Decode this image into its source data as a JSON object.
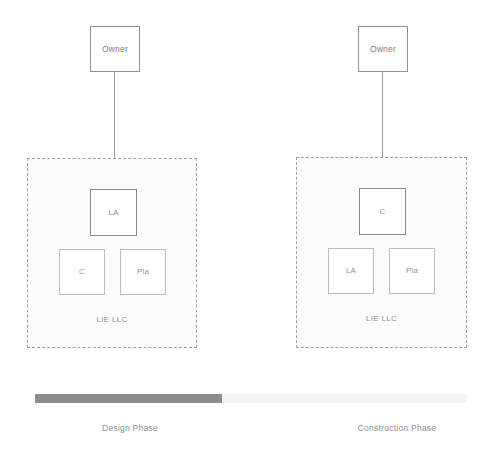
{
  "diagram": {
    "colors": {
      "box_border": "#909090",
      "primary_box_border": "#8d8d8d",
      "secondary_box_border": "#bdbdbd",
      "group_border": "#9f9f9f",
      "group_fill": "#fbfbfb",
      "bar_active": "#8c8c8c",
      "bar_inactive": "#f4f4f4",
      "text": "#8f8f8f"
    },
    "phases": [
      {
        "id": "design",
        "owner_label": "Owner",
        "group_caption": "LIE LLC",
        "phase_caption": "Design Phase",
        "roles": {
          "top": "LA",
          "left": "C",
          "right": "Pla"
        }
      },
      {
        "id": "construction",
        "owner_label": "Owner",
        "group_caption": "LIE LLC",
        "phase_caption": "Construction Phase",
        "roles": {
          "top": "C",
          "left": "LA",
          "right": "Pla"
        }
      }
    ],
    "timeline": {
      "active_segment": "Design Phase",
      "inactive_segment": "Construction Phase"
    }
  }
}
